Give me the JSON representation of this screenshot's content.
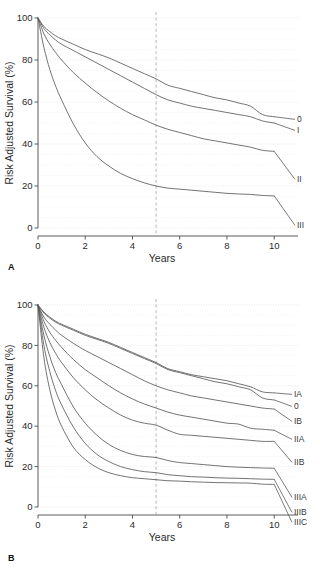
{
  "figure": {
    "panels": [
      {
        "letter": "A",
        "id": "panel-a",
        "y_axis_title": "Risk Adjusted Survival (%)",
        "x_axis_title": "Years",
        "reference_line_year": 5
      },
      {
        "letter": "B",
        "id": "panel-b",
        "y_axis_title": "Risk Adjusted Survival (%)",
        "x_axis_title": "Years",
        "reference_line_year": 5
      }
    ]
  },
  "chart_data": [
    {
      "type": "line",
      "panel": "A",
      "title": "",
      "xlabel": "Years",
      "ylabel": "Risk Adjusted Survival (%)",
      "xlim": [
        0,
        10.5
      ],
      "ylim": [
        0,
        100
      ],
      "xticks": [
        0,
        2,
        4,
        6,
        8,
        10
      ],
      "yticks": [
        0,
        20,
        40,
        60,
        80,
        100
      ],
      "grid": true,
      "legend_position": "right-inline",
      "annotations": [
        {
          "text": "vertical dashed reference line",
          "x": 5
        }
      ],
      "x": [
        0,
        0.25,
        0.5,
        0.75,
        1,
        1.5,
        2,
        2.5,
        3,
        3.5,
        4,
        4.5,
        5,
        5.5,
        6,
        6.5,
        7,
        7.5,
        8,
        8.5,
        9,
        9.5,
        10
      ],
      "series": [
        {
          "name": "0",
          "values": [
            100,
            96,
            93.5,
            91.5,
            90,
            87.5,
            85,
            83,
            81,
            78.5,
            76,
            73.5,
            71,
            68,
            66.5,
            65,
            63.5,
            62,
            61,
            59.5,
            58,
            54,
            53
          ]
        },
        {
          "name": "I",
          "values": [
            100,
            95,
            92,
            89.5,
            87.5,
            84.5,
            81.5,
            78.5,
            75.5,
            72.5,
            69.5,
            66.5,
            63.5,
            61,
            59.5,
            58,
            57,
            56,
            55,
            54,
            53,
            51,
            50
          ]
        },
        {
          "name": "II",
          "values": [
            100,
            92.5,
            87.5,
            83.5,
            80,
            74,
            69,
            64.5,
            60.5,
            57,
            54,
            51.5,
            49,
            47,
            45.5,
            44,
            42.5,
            41.5,
            40.5,
            39.5,
            38.5,
            37,
            36.5
          ]
        },
        {
          "name": "III",
          "values": [
            100,
            86,
            75.5,
            67.5,
            61,
            49.5,
            40.5,
            34,
            29.5,
            26,
            23.5,
            21.5,
            20,
            19,
            18.5,
            18,
            17.5,
            17,
            16.5,
            16.2,
            16,
            15.5,
            15.3
          ]
        }
      ]
    },
    {
      "type": "line",
      "panel": "B",
      "title": "",
      "xlabel": "Years",
      "ylabel": "Risk Adjusted Survival (%)",
      "xlim": [
        0,
        10.5
      ],
      "ylim": [
        0,
        100
      ],
      "xticks": [
        0,
        2,
        4,
        6,
        8,
        10
      ],
      "yticks": [
        0,
        20,
        40,
        60,
        80,
        100
      ],
      "grid": true,
      "legend_position": "right-inline",
      "annotations": [
        {
          "text": "vertical dashed reference line",
          "x": 5
        }
      ],
      "x": [
        0,
        0.25,
        0.5,
        0.75,
        1,
        1.5,
        2,
        2.5,
        3,
        3.5,
        4,
        4.5,
        5,
        5.5,
        6,
        6.5,
        7,
        7.5,
        8,
        8.5,
        9,
        9.5,
        10
      ],
      "series": [
        {
          "name": "IA",
          "values": [
            100,
            96.5,
            94,
            92,
            90.5,
            88,
            85.5,
            83.5,
            81.5,
            79,
            76.5,
            74,
            71.5,
            68.5,
            67,
            65.5,
            64.5,
            63.5,
            62.5,
            61,
            59.5,
            57,
            56.5
          ]
        },
        {
          "name": "0",
          "values": [
            100,
            96,
            93.5,
            91.5,
            90,
            87.5,
            85,
            83,
            81,
            78.5,
            76,
            73.5,
            71,
            68,
            66.5,
            65,
            63.5,
            62,
            61,
            59.5,
            58,
            54,
            53
          ]
        },
        {
          "name": "IB",
          "values": [
            100,
            94,
            90.5,
            87.5,
            85,
            81,
            77.5,
            74.5,
            71.5,
            68.5,
            65.5,
            62.5,
            60,
            58,
            56.5,
            55,
            54,
            53,
            52,
            51,
            50,
            49,
            48.5
          ]
        },
        {
          "name": "IIA",
          "values": [
            100,
            92,
            86.5,
            82.5,
            79,
            73,
            68,
            64,
            60,
            56.5,
            53.5,
            51,
            49,
            47,
            45.5,
            44.5,
            43.5,
            42.5,
            41.5,
            41,
            39,
            38.5,
            38
          ]
        },
        {
          "name": "IIB",
          "values": [
            100,
            89,
            81.5,
            76,
            71.5,
            64,
            58,
            53,
            49,
            45.5,
            43,
            41.5,
            40.5,
            38,
            36,
            35.5,
            35,
            34.5,
            34,
            33.5,
            33,
            32.5,
            32.5
          ]
        },
        {
          "name": "IIIA",
          "values": [
            100,
            85,
            74.5,
            66.5,
            60.5,
            49.5,
            41.5,
            35.5,
            31,
            28,
            26,
            25,
            24.5,
            23,
            22,
            21.5,
            21,
            20.5,
            20,
            19.7,
            19.5,
            19.3,
            19.2
          ]
        },
        {
          "name": "IIIB",
          "values": [
            100,
            80,
            67,
            57.5,
            50.5,
            39.5,
            31.5,
            26,
            22.5,
            20,
            18.5,
            17.5,
            17,
            16,
            15.5,
            15,
            14.8,
            14.5,
            14.3,
            14.2,
            14,
            13.8,
            13.7
          ]
        },
        {
          "name": "IIIC",
          "values": [
            100,
            74,
            58,
            47.5,
            40,
            29.5,
            23.5,
            19.5,
            17,
            15.5,
            14.5,
            14,
            13.5,
            13,
            12.8,
            12.5,
            12.3,
            12.1,
            12,
            11.9,
            11.8,
            11.3,
            11.2
          ]
        }
      ]
    }
  ],
  "styling": {
    "curve_color": "#5a5a5a",
    "axis_color": "#4a4a4a",
    "grid_color": "#c8c8d8",
    "reference_line_color": "#9a9a9a",
    "background": "#ffffff"
  }
}
